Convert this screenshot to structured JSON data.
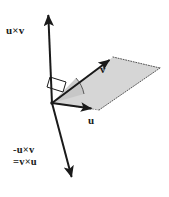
{
  "figure": {
    "background_color": "#ffffff",
    "stroke_color": "#1a1a1a",
    "plane_fill_color": "#d6d6d6",
    "angle_fill_color": "#c4c4c4",
    "width": 169,
    "height": 197
  },
  "labels": {
    "cross_up": "u×v",
    "cross_down_line1": "-u×v",
    "cross_down_line2": "=v×u",
    "vector_u": "u",
    "vector_v": "v"
  },
  "geometry": {
    "origin": [
      52,
      103
    ],
    "axis_top_tip": [
      48,
      11
    ],
    "axis_bottom_tip": [
      73,
      180
    ],
    "u_tip": [
      95,
      110
    ],
    "v_tip": [
      113,
      57
    ],
    "plane_far_corner": [
      160,
      68
    ],
    "right_angle_marker": true,
    "angle_arc": true
  }
}
